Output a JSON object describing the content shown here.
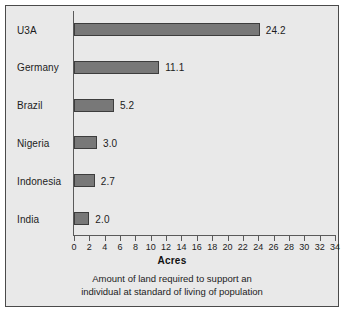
{
  "chart_data": {
    "type": "bar",
    "orientation": "horizontal",
    "title": "",
    "xlabel": "Acres",
    "ylabel": "",
    "xlim": [
      0,
      34
    ],
    "xticks": [
      0,
      2,
      4,
      6,
      8,
      10,
      12,
      14,
      16,
      18,
      20,
      22,
      24,
      26,
      28,
      30,
      32,
      34
    ],
    "xtick_labels": [
      "0",
      "2",
      "4",
      "6",
      "8",
      "10",
      "12",
      "14",
      "16",
      "18",
      "20",
      "22",
      "24",
      "26",
      "28",
      "30",
      "32",
      "34"
    ],
    "grid": false,
    "legend": false,
    "bar_color": "#787878",
    "bar_edge_color": "#3d3d3d",
    "background_color": "#e9e9e9",
    "categories": [
      "U3A",
      "Germany",
      "Brazil",
      "Nigeria",
      "Indonesia",
      "India"
    ],
    "values": [
      24.2,
      11.1,
      5.2,
      3.0,
      2.7,
      2.0
    ],
    "value_labels": [
      "24.2",
      "11.1",
      "5.2",
      "3.0",
      "2.7",
      "2.0"
    ],
    "caption_lines": [
      "Amount of land required to support an",
      "individual at standard of living of population"
    ]
  }
}
